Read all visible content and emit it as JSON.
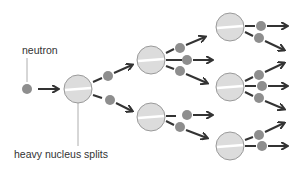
{
  "diagram": {
    "labels": {
      "neutron": "neutron",
      "nucleus": "heavy nucleus splits"
    },
    "colors": {
      "nucleus_fill": "#dcdcdc",
      "nucleus_stroke": "#9a9a9a",
      "neutron_fill": "#8e8e8e",
      "arrow": "#333333"
    },
    "generations": [
      {
        "level": 1,
        "nuclei": 1,
        "neutrons_released": 2
      },
      {
        "level": 2,
        "nuclei": 2,
        "neutrons_released": [
          3,
          2
        ]
      },
      {
        "level": 3,
        "nuclei": 3,
        "neutrons_released": [
          2,
          3,
          2
        ]
      }
    ]
  }
}
